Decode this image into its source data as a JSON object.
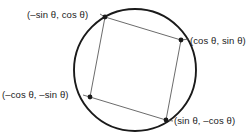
{
  "figure": {
    "background_color": "#ffffff",
    "circle": {
      "name": "unit-circle",
      "center_x": 135,
      "center_y": 70,
      "radius": 61,
      "stroke_color": "#1a1a1a",
      "stroke_width": 1.9,
      "fill": "none"
    },
    "square": {
      "name": "inscribed-square",
      "stroke_color": "#5a5a5a",
      "stroke_width": 0.9,
      "fill": "none",
      "vertices": [
        {
          "id": "top-left",
          "x": 105,
          "y": 17,
          "label": "(–sin θ, cos θ)"
        },
        {
          "id": "right",
          "x": 181,
          "y": 40,
          "label": "(cos θ, sin θ)"
        },
        {
          "id": "bottom-right",
          "x": 166,
          "y": 120,
          "label": "(sin θ, –cos θ)"
        },
        {
          "id": "bottom-left",
          "x": 90,
          "y": 97,
          "label": "(–cos θ, –sin θ)"
        }
      ]
    },
    "vertex_dots": {
      "name": "vertex-dot",
      "radius": 2.4,
      "color": "#1a1a1a"
    },
    "leader_lines": {
      "stroke_color": "#4a4a4a",
      "stroke_width": 0.8
    },
    "labels": {
      "top_left": "(–sin θ, cos θ)",
      "right": "(cos θ, sin θ)",
      "bottom_left": "(–cos θ, –sin θ)",
      "bottom_right": "(sin θ, –cos θ)",
      "text_color": "#1b1b1b"
    }
  }
}
